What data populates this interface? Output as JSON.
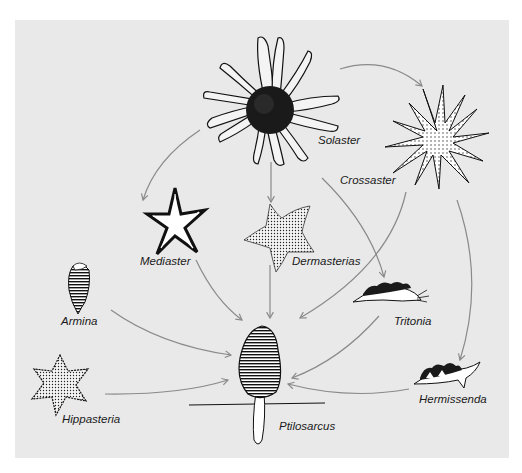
{
  "diagram": {
    "type": "food-web",
    "background_color": "#e9e9e9",
    "arrow_color": "#8a8a8a",
    "nodes": [
      {
        "id": "solaster",
        "label": "Solaster"
      },
      {
        "id": "crossaster",
        "label": "Crossaster"
      },
      {
        "id": "mediaster",
        "label": "Mediaster"
      },
      {
        "id": "dermasterias",
        "label": "Dermasterias"
      },
      {
        "id": "armina",
        "label": "Armina"
      },
      {
        "id": "tritonia",
        "label": "Tritonia"
      },
      {
        "id": "hippasteria",
        "label": "Hippasteria"
      },
      {
        "id": "hermissenda",
        "label": "Hermissenda"
      },
      {
        "id": "ptilosarcus",
        "label": "Ptilosarcus"
      }
    ],
    "edges": [
      {
        "from": "solaster",
        "to": "crossaster"
      },
      {
        "from": "solaster",
        "to": "mediaster"
      },
      {
        "from": "solaster",
        "to": "dermasterias"
      },
      {
        "from": "solaster",
        "to": "tritonia"
      },
      {
        "from": "crossaster",
        "to": "ptilosarcus"
      },
      {
        "from": "crossaster",
        "to": "hermissenda"
      },
      {
        "from": "mediaster",
        "to": "ptilosarcus"
      },
      {
        "from": "dermasterias",
        "to": "ptilosarcus"
      },
      {
        "from": "armina",
        "to": "ptilosarcus"
      },
      {
        "from": "tritonia",
        "to": "ptilosarcus"
      },
      {
        "from": "hippasteria",
        "to": "ptilosarcus"
      },
      {
        "from": "hermissenda",
        "to": "ptilosarcus"
      }
    ]
  }
}
